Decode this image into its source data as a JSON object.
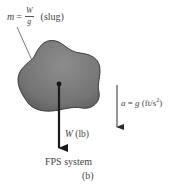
{
  "figure": {
    "mass_label": {
      "symbol": "m",
      "equals": "=",
      "numerator": "W",
      "denominator": "g",
      "unit": "(slug)"
    },
    "weight_label": {
      "symbol": "W",
      "unit": "(lb)"
    },
    "acceleration_label": {
      "symbol": "a",
      "equals": "=",
      "value": "g",
      "unit_prefix": "(ft/s",
      "unit_exponent": "2",
      "unit_suffix": ")"
    },
    "system_label": "FPS system",
    "subfigure_label": "(b)",
    "colors": {
      "body_fill": "#7a7a7a",
      "body_edge": "#3c3c3c",
      "arrow": "#1a1a1a",
      "text": "#444444"
    }
  }
}
